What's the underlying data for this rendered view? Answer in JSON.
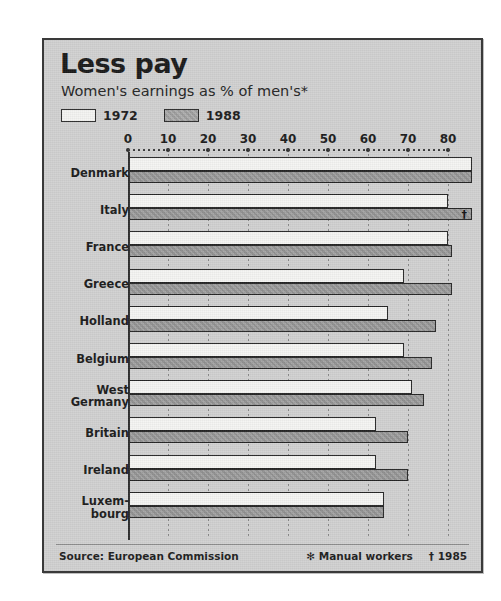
{
  "title": "Less pay",
  "subtitle": "Women's earnings as % of men's*",
  "legend": [
    {
      "label": "1972",
      "swatch": "white-swatch"
    },
    {
      "label": "1988",
      "swatch": "gray-swatch"
    }
  ],
  "footer": {
    "source": "Source: European Commission",
    "note_manual": "✻ Manual workers",
    "note_year": "† 1985"
  },
  "chart_data": {
    "type": "bar",
    "orientation": "horizontal",
    "title": "Less pay",
    "subtitle": "Women's earnings as % of men's*",
    "xlabel": "",
    "ylabel": "",
    "xlim": [
      0,
      80
    ],
    "xticks": [
      0,
      10,
      20,
      30,
      40,
      50,
      60,
      70,
      80
    ],
    "tick_labels": [
      "0",
      "10",
      "20",
      "30",
      "40",
      "50",
      "60",
      "70",
      "80"
    ],
    "grid": true,
    "legend_position": "top-left",
    "categories": [
      "Denmark",
      "Italy",
      "France",
      "Greece",
      "Holland",
      "Belgium",
      "West Germany",
      "Britain",
      "Ireland",
      "Luxembourg"
    ],
    "series": [
      {
        "name": "1972",
        "values": [
          86,
          80,
          80,
          69,
          65,
          69,
          71,
          62,
          62,
          64
        ]
      },
      {
        "name": "1988",
        "values": [
          86,
          86,
          81,
          81,
          77,
          76,
          74,
          70,
          70,
          64
        ]
      }
    ],
    "annotations": [
      {
        "category": "Italy",
        "series": "1988",
        "marker": "†",
        "meaning": "1985"
      }
    ],
    "source": "European Commission"
  }
}
